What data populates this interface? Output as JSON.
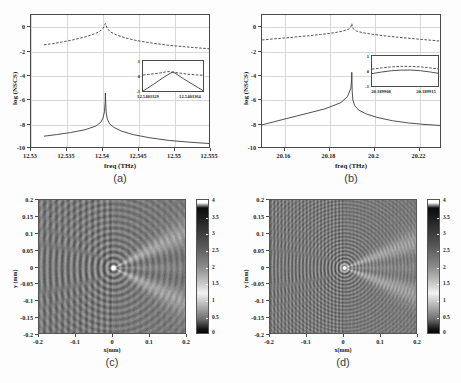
{
  "figure": {
    "background_color": "#fdfdfd",
    "panels": [
      "(a)",
      "(b)",
      "(c)",
      "(d)"
    ]
  },
  "chart_data": [
    {
      "id": "panel-a",
      "type": "line",
      "caption": "(a)",
      "title": "",
      "xlabel": "freq (THz)",
      "ylabel": "log (NSCS)",
      "xlim": [
        12.53,
        12.555
      ],
      "ylim": [
        -10,
        1
      ],
      "xticks": [
        "12.53",
        "12.535",
        "12.54",
        "12.545",
        "12.55",
        "12.555"
      ],
      "xtick_values": [
        12.53,
        12.535,
        12.54,
        12.545,
        12.55,
        12.555
      ],
      "yticks": [
        "0",
        "-2",
        "-4",
        "-6",
        "-8",
        "-10"
      ],
      "ytick_values": [
        0,
        -2,
        -4,
        -6,
        -8,
        -10
      ],
      "grid": true,
      "resonance_freq": 12.5403,
      "series": [
        {
          "name": "upper-branch",
          "style": "dashed",
          "color": "#3c3c3c",
          "x": [
            12.5318,
            12.533,
            12.5345,
            12.536,
            12.5375,
            12.5385,
            12.5392,
            12.5397,
            12.54,
            12.5402,
            12.54033,
            12.5404,
            12.5406,
            12.541,
            12.5418,
            12.543,
            12.5445,
            12.5465,
            12.549,
            12.552,
            12.5545,
            12.557
          ],
          "y": [
            -1.45,
            -1.35,
            -1.2,
            -1.02,
            -0.8,
            -0.62,
            -0.45,
            -0.28,
            -0.1,
            0.12,
            0.3,
            0.18,
            -0.1,
            -0.38,
            -0.62,
            -0.86,
            -1.08,
            -1.28,
            -1.48,
            -1.64,
            -1.76,
            -1.85
          ]
        },
        {
          "name": "lower-branch",
          "style": "solid",
          "color": "#3c3c3c",
          "x": [
            12.5318,
            12.5335,
            12.5355,
            12.5375,
            12.539,
            12.5397,
            12.54,
            12.5402,
            12.5403,
            12.54033,
            12.54038,
            12.54045,
            12.5406,
            12.5409,
            12.5415,
            12.5425,
            12.5442,
            12.5465,
            12.5492,
            12.5522,
            12.5548,
            12.5572
          ],
          "y": [
            -8.95,
            -8.82,
            -8.65,
            -8.42,
            -8.12,
            -7.8,
            -7.45,
            -6.95,
            -6.2,
            -5.4,
            -6.3,
            -7.05,
            -7.55,
            -7.92,
            -8.22,
            -8.52,
            -8.82,
            -9.08,
            -9.3,
            -9.45,
            -9.55,
            -9.62
          ]
        }
      ],
      "inset": {
        "xlim": [
          12.5403329,
          12.5403364
        ],
        "ylim": [
          -1,
          1
        ],
        "xticks": [
          "12.5403329",
          "12.5403364"
        ],
        "yticks": [
          "1",
          "0",
          "-1"
        ],
        "ytick_values": [
          1,
          0,
          -1
        ],
        "series": [
          {
            "name": "inset-peak-dashed",
            "style": "dashed",
            "x": [
              12.5403329,
              12.5403332,
              12.5403335,
              12.5403339,
              12.5403343,
              12.5403346,
              12.540335,
              12.5403354,
              12.5403358,
              12.5403364
            ],
            "y": [
              0.12,
              0.16,
              0.2,
              0.26,
              0.34,
              0.3,
              0.24,
              0.18,
              0.14,
              0.1
            ]
          },
          {
            "name": "inset-v-solid",
            "style": "solid",
            "x": [
              12.5403329,
              12.5403335,
              12.5403342,
              12.5403346,
              12.5403352,
              12.540336,
              12.5403364
            ],
            "y": [
              -0.88,
              -0.45,
              0.08,
              0.32,
              -0.12,
              -0.66,
              -0.92
            ]
          }
        ]
      }
    },
    {
      "id": "panel-b",
      "type": "line",
      "caption": "(b)",
      "title": "",
      "xlabel": "freq (THz)",
      "ylabel": "log (NSCS)",
      "xlim": [
        20.15,
        20.23
      ],
      "ylim": [
        -10,
        1
      ],
      "xticks": [
        "20.16",
        "20.18",
        "20.2",
        "20.22"
      ],
      "xtick_values": [
        20.16,
        20.18,
        20.2,
        20.22
      ],
      "yticks": [
        "0",
        "-2",
        "-4",
        "-6",
        "-8",
        "-10"
      ],
      "ytick_values": [
        0,
        -2,
        -4,
        -6,
        -8,
        -10
      ],
      "grid": true,
      "resonance_freq": 20.1899,
      "series": [
        {
          "name": "upper-branch",
          "style": "dashed",
          "color": "#3c3c3c",
          "x": [
            20.15,
            20.154,
            20.159,
            20.164,
            20.17,
            20.176,
            20.182,
            20.186,
            20.1885,
            20.1895,
            20.1899,
            20.1901,
            20.1905,
            20.192,
            20.195,
            20.199,
            20.204,
            20.21,
            20.216,
            20.222,
            20.227,
            20.23
          ],
          "y": [
            -1.05,
            -0.98,
            -0.9,
            -0.82,
            -0.72,
            -0.6,
            -0.46,
            -0.32,
            -0.16,
            0.02,
            0.3,
            0.14,
            -0.12,
            -0.32,
            -0.46,
            -0.58,
            -0.7,
            -0.82,
            -0.92,
            -1.02,
            -1.1,
            -1.16
          ]
        },
        {
          "name": "lower-branch",
          "style": "solid",
          "color": "#3c3c3c",
          "x": [
            20.15,
            20.155,
            20.162,
            20.17,
            20.178,
            20.185,
            20.188,
            20.1895,
            20.18985,
            20.1899,
            20.18998,
            20.1901,
            20.1904,
            20.1912,
            20.193,
            20.196,
            20.201,
            20.208,
            20.215,
            20.222,
            20.227,
            20.23
          ],
          "y": [
            -8.02,
            -7.78,
            -7.45,
            -7.08,
            -6.7,
            -6.2,
            -5.7,
            -5.0,
            -4.2,
            -3.7,
            -4.4,
            -5.3,
            -6.0,
            -6.45,
            -6.8,
            -7.1,
            -7.4,
            -7.68,
            -7.86,
            -7.98,
            -8.04,
            -8.08
          ]
        }
      ],
      "inset": {
        "xlim": [
          20.189908,
          20.189915
        ],
        "ylim": [
          -1,
          1
        ],
        "xticks": [
          "20.189908",
          "20.189915"
        ],
        "yticks": [
          "1",
          "0",
          "-1"
        ],
        "ytick_values": [
          1,
          0,
          -1
        ],
        "series": [
          {
            "name": "inset-upper-dashed",
            "style": "dashed",
            "x": [
              20.189908,
              20.189909,
              20.18991,
              20.189911,
              20.189912,
              20.189913,
              20.189914,
              20.189915
            ],
            "y": [
              0.18,
              0.26,
              0.32,
              0.35,
              0.35,
              0.32,
              0.26,
              0.18
            ]
          },
          {
            "name": "inset-lower-solid",
            "style": "solid",
            "x": [
              20.189908,
              20.189909,
              20.18991,
              20.189911,
              20.189912,
              20.189913,
              20.189914,
              20.189915
            ],
            "y": [
              -0.1,
              0.0,
              0.08,
              0.12,
              0.12,
              0.08,
              0.0,
              -0.1
            ]
          }
        ]
      }
    },
    {
      "id": "panel-c",
      "type": "heatmap",
      "caption": "(c)",
      "title": "",
      "xlabel": "x(mm)",
      "ylabel": "y (mm)",
      "xlim": [
        -0.2,
        0.2
      ],
      "ylim": [
        -0.2,
        0.2
      ],
      "xticks": [
        "-0.2",
        "-0.1",
        "0",
        "0.1",
        "0.2"
      ],
      "xtick_values": [
        -0.2,
        -0.1,
        0,
        0.1,
        0.2
      ],
      "yticks": [
        "0.2",
        "0.15",
        "0.1",
        "0.05",
        "0",
        "-0.05",
        "-0.1",
        "-0.15",
        "-0.2"
      ],
      "ytick_values": [
        0.2,
        0.15,
        0.1,
        0.05,
        0,
        -0.05,
        -0.1,
        -0.15,
        -0.2
      ],
      "colormap": "gray",
      "colorbar": {
        "min": 0,
        "max": 4,
        "ticks": [
          "4",
          "3.5",
          "3",
          "2.5",
          "2",
          "1.5",
          "1",
          "0.5",
          "0"
        ],
        "tick_values": [
          4,
          3.5,
          3,
          2.5,
          2,
          1.5,
          1,
          0.5,
          0
        ]
      },
      "field": {
        "pattern": "scattering-near-field",
        "wavelength_px": 6.0,
        "source_x": 0.0,
        "source_y": 0.0,
        "background_level": 1.9,
        "forward_beam_half_angle_deg": 26
      }
    },
    {
      "id": "panel-d",
      "type": "heatmap",
      "caption": "(d)",
      "title": "",
      "xlabel": "x(mm)",
      "ylabel": "y (mm)",
      "xlim": [
        -0.2,
        0.2
      ],
      "ylim": [
        -0.2,
        0.2
      ],
      "xticks": [
        "-0.2",
        "-0.1",
        "0",
        "0.1",
        "0.2"
      ],
      "xtick_values": [
        -0.2,
        -0.1,
        0,
        0.1,
        0.2
      ],
      "yticks": [
        "0.2",
        "0.15",
        "0.1",
        "0.05",
        "0",
        "-0.05",
        "-0.1",
        "-0.15",
        "-0.2"
      ],
      "ytick_values": [
        0.2,
        0.15,
        0.1,
        0.05,
        0,
        -0.05,
        -0.1,
        -0.15,
        -0.2
      ],
      "colormap": "gray",
      "colorbar": {
        "min": 0,
        "max": 4,
        "ticks": [
          "4",
          "3.5",
          "3",
          "2.5",
          "2",
          "1.5",
          "1",
          "0.5",
          "0"
        ],
        "tick_values": [
          4,
          3.5,
          3,
          2.5,
          2,
          1.5,
          1,
          0.5,
          0
        ]
      },
      "field": {
        "pattern": "scattering-near-field",
        "wavelength_px": 3.6,
        "source_x": 0.0,
        "source_y": 0.0,
        "background_level": 1.9,
        "forward_beam_half_angle_deg": 20
      }
    }
  ]
}
